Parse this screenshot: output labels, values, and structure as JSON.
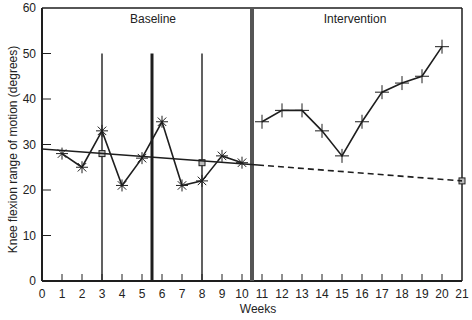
{
  "chart_data": {
    "type": "line",
    "title": "",
    "xlabel": "Weeks",
    "ylabel": "Knee flexion range of motion (degrees)",
    "xlim": [
      0,
      21
    ],
    "ylim": [
      0,
      60
    ],
    "x_ticks": [
      0,
      1,
      2,
      3,
      4,
      5,
      6,
      7,
      8,
      9,
      10,
      11,
      12,
      13,
      14,
      15,
      16,
      17,
      18,
      19,
      20,
      21
    ],
    "y_ticks": [
      0,
      10,
      20,
      30,
      40,
      50,
      60
    ],
    "grid": false,
    "phases": [
      {
        "label": "Baseline",
        "x_start": 0,
        "x_end": 10.5
      },
      {
        "label": "Intervention",
        "x_start": 10.5,
        "x_end": 21
      }
    ],
    "phase_change_line_x": 10.5,
    "split_middle_lines": [
      {
        "x": 3,
        "top": 50,
        "weight": "thin"
      },
      {
        "x": 5.5,
        "top": 50,
        "weight": "thick"
      },
      {
        "x": 8,
        "top": 50,
        "weight": "thin"
      }
    ],
    "series": [
      {
        "name": "Baseline data",
        "marker": "asterisk",
        "x": [
          1,
          2,
          3,
          4,
          5,
          6,
          7,
          8,
          9,
          10
        ],
        "values": [
          28,
          25,
          33,
          21,
          27,
          35,
          21,
          22,
          27.5,
          26
        ]
      },
      {
        "name": "Intervention data",
        "marker": "plus",
        "x": [
          11,
          12,
          13,
          14,
          15,
          16,
          17,
          18,
          19,
          20
        ],
        "values": [
          35,
          37.5,
          37.5,
          33,
          27.5,
          35,
          41.5,
          43.5,
          45,
          51.5
        ]
      },
      {
        "name": "Celeration trend line (baseline)",
        "style": "solid",
        "x": [
          0,
          10.8
        ],
        "values": [
          29,
          25.5
        ]
      },
      {
        "name": "Celeration trend line (projected)",
        "style": "dashed",
        "x": [
          10.8,
          21
        ],
        "values": [
          25.5,
          22
        ]
      },
      {
        "name": "Mid-date median points",
        "marker": "square",
        "x": [
          3,
          8,
          21
        ],
        "values": [
          28,
          26,
          22
        ]
      }
    ]
  }
}
